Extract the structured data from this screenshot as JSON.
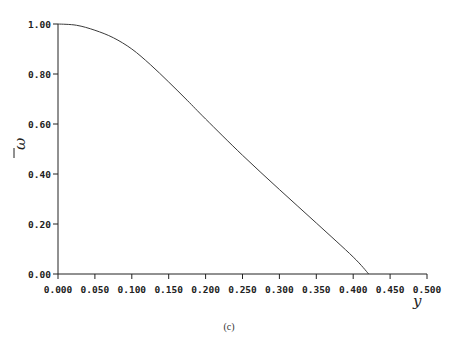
{
  "chart_data": {
    "type": "line",
    "title": "",
    "caption": "(c)",
    "xlabel": "y",
    "ylabel": "ω̄",
    "xlim": [
      0,
      0.5
    ],
    "ylim": [
      0,
      1.0
    ],
    "grid": false,
    "legend": null,
    "x_ticks": [
      "0.000",
      "0.050",
      "0.100",
      "0.150",
      "0.200",
      "0.250",
      "0.300",
      "0.350",
      "0.400",
      "0.450",
      "0.500"
    ],
    "y_ticks": [
      "0.00",
      "0.20",
      "0.40",
      "0.60",
      "0.80",
      "1.00"
    ],
    "series": [
      {
        "name": "ω̄(y)",
        "x": [
          0.0,
          0.025,
          0.05,
          0.075,
          0.1,
          0.125,
          0.15,
          0.175,
          0.2,
          0.25,
          0.3,
          0.35,
          0.4,
          0.421
        ],
        "y": [
          1.0,
          0.995,
          0.975,
          0.945,
          0.9,
          0.838,
          0.768,
          0.695,
          0.62,
          0.475,
          0.338,
          0.204,
          0.068,
          0.0
        ]
      }
    ]
  },
  "labels": {
    "x_axis_var": "y",
    "y_axis_var": "ω",
    "caption": "(c)"
  },
  "style": {
    "line_color": "#3a3a3a",
    "axis_color": "#222222"
  }
}
